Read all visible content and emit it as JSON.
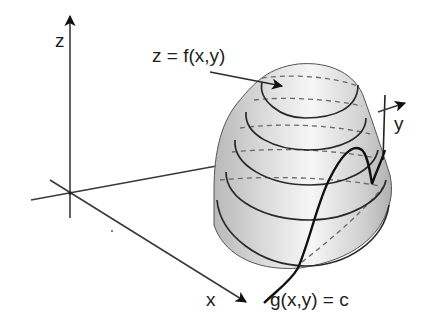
{
  "diagram": {
    "type": "3d-surface-with-constraint-curve",
    "axes": {
      "z": {
        "label": "z"
      },
      "x": {
        "label": "x"
      },
      "y": {
        "label": "y"
      }
    },
    "surface": {
      "label": "z = f(x,y)",
      "contour_count": 5,
      "fill_color": "#c8c8c8",
      "highlight_color": "#f4f4f4"
    },
    "constraint_curve": {
      "label": "g(x,y) = c",
      "color": "#111111"
    },
    "colors": {
      "background": "#ffffff",
      "axis": "#3a3a3a",
      "contour": "#2a2a2a",
      "hidden_line": "#6a6a6a"
    }
  }
}
